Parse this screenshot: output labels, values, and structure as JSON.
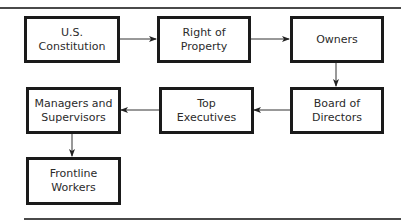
{
  "diagram": {
    "type": "flowchart",
    "nodes": [
      {
        "id": "constitution",
        "label": "U.S. Constitution"
      },
      {
        "id": "property",
        "label": "Right of Property"
      },
      {
        "id": "owners",
        "label": "Owners"
      },
      {
        "id": "board",
        "label": "Board of\nDirectors"
      },
      {
        "id": "executives",
        "label": "Top Executives"
      },
      {
        "id": "managers",
        "label": "Managers and\nSupervisors"
      },
      {
        "id": "frontline",
        "label": "Frontline\nWorkers"
      }
    ],
    "edges": [
      {
        "from": "constitution",
        "to": "property"
      },
      {
        "from": "property",
        "to": "owners"
      },
      {
        "from": "owners",
        "to": "board"
      },
      {
        "from": "board",
        "to": "executives"
      },
      {
        "from": "executives",
        "to": "managers"
      },
      {
        "from": "managers",
        "to": "frontline"
      }
    ],
    "colors": {
      "border": "#1a1a1a",
      "text": "#2b2b2b",
      "rule": "#4a4a4a",
      "arrow": "#333333"
    }
  }
}
